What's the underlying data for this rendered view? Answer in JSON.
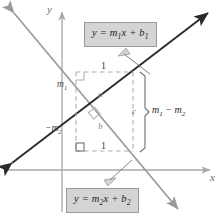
{
  "figure": {
    "axes": {
      "x_label": "x",
      "y_label": "y",
      "axis_color": "#a8a8a8"
    },
    "lines": [
      {
        "id": "line1",
        "equation_label": "y = m",
        "equation_sub1": "1",
        "equation_mid": "x + b",
        "equation_sub2": "1",
        "color": "#2b2b2b",
        "direction": "ascending",
        "arrows": "both"
      },
      {
        "id": "line2",
        "equation_label": "y = m",
        "equation_sub1": "2",
        "equation_mid": "x + b",
        "equation_sub2": "2",
        "color": "#9a9a9a",
        "direction": "descending",
        "arrows": "both"
      }
    ],
    "construction": {
      "run_top_label": "1",
      "run_bottom_label": "1",
      "rise_label": "m",
      "rise_sub": "1",
      "fall_label": "−m",
      "fall_sub": "2",
      "hyp_upper_label": "a",
      "hyp_lower_label": "b",
      "bracket_label": "c",
      "bracket_expression": "m",
      "bracket_sub1": "1",
      "bracket_minus": " − m",
      "bracket_sub2": "2",
      "dash_color": "#b0b0b0",
      "right_angle_marker": "square"
    }
  }
}
